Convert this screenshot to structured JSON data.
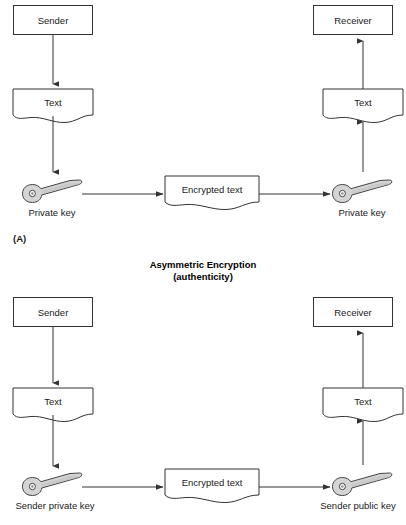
{
  "figure": {
    "title_line1": "Asymmetric Encryption",
    "title_line2": "(authenticity)",
    "panel_a_tag": "(A)"
  },
  "panel_a": {
    "sender_box": "Sender",
    "sender_text_doc": "Text",
    "sender_key_label": "Private key",
    "encrypted_doc": "Encrypted text",
    "receiver_key_label": "Private key",
    "receiver_text_doc": "Text",
    "receiver_box": "Receiver"
  },
  "panel_b": {
    "sender_box": "Sender",
    "sender_text_doc": "Text",
    "sender_key_label": "Sender private key",
    "encrypted_doc": "Encrypted text",
    "receiver_key_label": "Sender public key",
    "receiver_text_doc": "Text",
    "receiver_box": "Receiver"
  },
  "colors": {
    "stroke": "#333333",
    "key_fill": "#d4d4d4",
    "key_outline": "#444444",
    "background": "#ffffff",
    "text": "#1a1a1a"
  }
}
